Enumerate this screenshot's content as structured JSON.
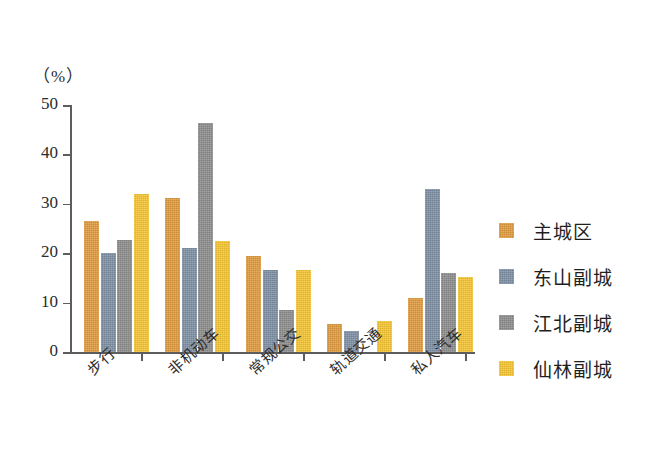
{
  "chart_data": {
    "type": "bar",
    "title": "",
    "subtitle": "",
    "xlabel": "",
    "ylabel": "",
    "unit_label": "（%）",
    "ylim": [
      0,
      50
    ],
    "ytick_values": [
      50,
      40,
      30,
      20,
      10,
      0
    ],
    "ytick_labels": [
      "50",
      "40",
      "30",
      "20",
      "10",
      "0"
    ],
    "grid": false,
    "legend_position": "right",
    "categories": [
      "步行",
      "非机动车",
      "常规公交",
      "轨道交通",
      "私人汽车"
    ],
    "series": [
      {
        "name": "主城区",
        "color": "#e09a3e",
        "values": [
          26.5,
          31.1,
          19.5,
          5.7,
          11.0
        ]
      },
      {
        "name": "东山副城",
        "color": "#7d8fa3",
        "values": [
          20.0,
          21.1,
          16.7,
          4.3,
          33.1
        ]
      },
      {
        "name": "江北副城",
        "color": "#8c8c8c",
        "values": [
          22.6,
          46.3,
          8.5,
          0.0,
          16.0
        ]
      },
      {
        "name": "仙林副城",
        "color": "#f5c431",
        "values": [
          32.0,
          22.4,
          16.7,
          6.3,
          15.2
        ]
      }
    ]
  }
}
